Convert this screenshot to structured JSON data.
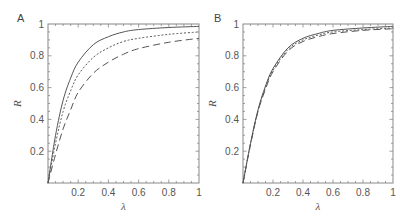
{
  "chart_data": [
    {
      "panel": "A",
      "type": "line",
      "xlabel": "λ",
      "ylabel": "R",
      "xlim": [
        0,
        1
      ],
      "ylim": [
        0,
        1
      ],
      "xticks": [
        "0.2",
        "0.4",
        "0.6",
        "0.8",
        "1"
      ],
      "yticks": [
        "0.2",
        "0.4",
        "0.6",
        "0.8",
        "1"
      ],
      "grid": false,
      "x": [
        0,
        0.05,
        0.1,
        0.15,
        0.2,
        0.3,
        0.4,
        0.5,
        0.6,
        0.8,
        1.0
      ],
      "series": [
        {
          "name": "solid",
          "style": "solid",
          "values": [
            0,
            0.3,
            0.52,
            0.66,
            0.76,
            0.87,
            0.92,
            0.95,
            0.965,
            0.978,
            0.985
          ]
        },
        {
          "name": "dotted",
          "style": "dotted",
          "values": [
            0,
            0.25,
            0.45,
            0.58,
            0.68,
            0.79,
            0.85,
            0.89,
            0.91,
            0.935,
            0.95
          ]
        },
        {
          "name": "dashed",
          "style": "dashed",
          "values": [
            0,
            0.18,
            0.34,
            0.46,
            0.57,
            0.69,
            0.76,
            0.81,
            0.845,
            0.885,
            0.91
          ]
        }
      ]
    },
    {
      "panel": "B",
      "type": "line",
      "xlabel": "λ",
      "ylabel": "R",
      "xlim": [
        0,
        1
      ],
      "ylim": [
        0,
        1
      ],
      "xticks": [
        "0.2",
        "0.4",
        "0.6",
        "0.8",
        "1"
      ],
      "yticks": [
        "0.2",
        "0.4",
        "0.6",
        "0.8",
        "1"
      ],
      "grid": false,
      "x": [
        0,
        0.05,
        0.1,
        0.15,
        0.2,
        0.3,
        0.4,
        0.5,
        0.6,
        0.8,
        1.0
      ],
      "series": [
        {
          "name": "solid",
          "style": "solid",
          "values": [
            0,
            0.25,
            0.46,
            0.61,
            0.72,
            0.85,
            0.91,
            0.94,
            0.96,
            0.975,
            0.985
          ]
        },
        {
          "name": "dotted",
          "style": "dotted",
          "values": [
            0,
            0.245,
            0.455,
            0.6,
            0.71,
            0.84,
            0.9,
            0.93,
            0.95,
            0.965,
            0.975
          ]
        },
        {
          "name": "dashed",
          "style": "dashed",
          "values": [
            0,
            0.24,
            0.45,
            0.59,
            0.7,
            0.83,
            0.89,
            0.92,
            0.94,
            0.96,
            0.97
          ]
        }
      ]
    }
  ],
  "panels": {
    "a": {
      "label": "A"
    },
    "b": {
      "label": "B"
    }
  }
}
